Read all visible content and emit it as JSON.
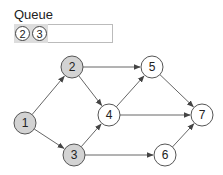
{
  "queue": {
    "label": "Queue",
    "items": [
      "2",
      "3"
    ]
  },
  "graph": {
    "nodes": [
      {
        "id": "1",
        "x": 25,
        "y": 123,
        "visited": true
      },
      {
        "id": "2",
        "x": 72,
        "y": 67,
        "visited": true
      },
      {
        "id": "3",
        "x": 74,
        "y": 155,
        "visited": true
      },
      {
        "id": "4",
        "x": 109,
        "y": 115,
        "visited": false
      },
      {
        "id": "5",
        "x": 152,
        "y": 67,
        "visited": false
      },
      {
        "id": "6",
        "x": 165,
        "y": 155,
        "visited": false
      },
      {
        "id": "7",
        "x": 202,
        "y": 115,
        "visited": false
      }
    ],
    "edges": [
      [
        "1",
        "2"
      ],
      [
        "1",
        "3"
      ],
      [
        "2",
        "5"
      ],
      [
        "2",
        "4"
      ],
      [
        "3",
        "4"
      ],
      [
        "3",
        "6"
      ],
      [
        "4",
        "5"
      ],
      [
        "4",
        "7"
      ],
      [
        "5",
        "7"
      ],
      [
        "6",
        "7"
      ]
    ],
    "colors": {
      "visited": "#d3d3d3",
      "unvisited": "#ffffff",
      "stroke": "#555555",
      "edge": "#666666"
    }
  }
}
